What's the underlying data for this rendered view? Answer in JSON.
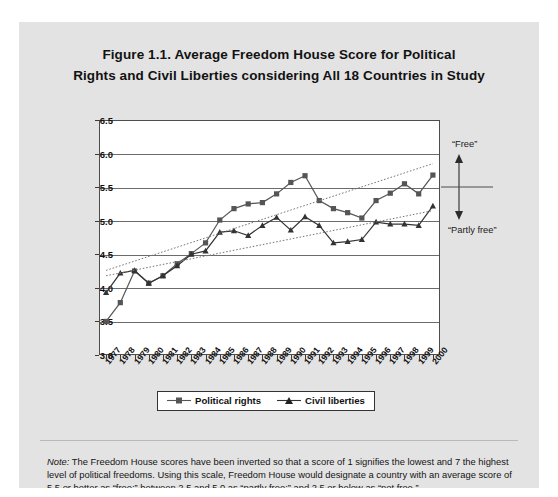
{
  "figure": {
    "title_line1": "Figure 1.1.  Average Freedom House Score for Political",
    "title_line2": "Rights and Civil Liberties considering All 18 Countries in Study",
    "note_prefix": "Note:",
    "note_text": " The Freedom House scores have been inverted so that a score of 1 signifies the lowest and 7 the highest level of political freedoms. Using this scale, Freedom House would designate a country with an average score of 5.5 or better as “free;” between 2.5 and 5.0 as “partly free;” and 2.5 or below as “not free.”"
  },
  "annotations": {
    "free": "“Free”",
    "partly_free": "“Partly free”",
    "threshold_value": 5.5
  },
  "legend": {
    "position": "bottom",
    "items": [
      {
        "label": "Political rights",
        "marker": "square",
        "color": "#555555"
      },
      {
        "label": "Civil liberties",
        "marker": "triangle",
        "color": "#333333"
      }
    ]
  },
  "chart_data": {
    "type": "line",
    "title": "Figure 1.1. Average Freedom House Score for Political Rights and Civil Liberties considering All 18 Countries in Study",
    "xlabel": "",
    "ylabel": "",
    "grid": true,
    "ylim": [
      3.0,
      6.5
    ],
    "yticks": [
      "3.0",
      "3.5",
      "4.0",
      "4.5",
      "5.0",
      "5.5",
      "6.0",
      "6.5"
    ],
    "categories": [
      "1977",
      "1978",
      "1979",
      "1980",
      "1981",
      "1982",
      "1983",
      "1984",
      "1985",
      "1986",
      "1987",
      "1988",
      "1989",
      "1990",
      "1991",
      "1992",
      "1993",
      "1994",
      "1995",
      "1996",
      "1997",
      "1998",
      "1999",
      "2000"
    ],
    "series": [
      {
        "name": "Political rights",
        "marker": "square",
        "color": "#555555",
        "values": [
          3.5,
          3.78,
          4.25,
          4.07,
          4.18,
          4.36,
          4.51,
          4.67,
          5.01,
          5.18,
          5.25,
          5.27,
          5.4,
          5.57,
          5.67,
          5.3,
          5.18,
          5.12,
          5.04,
          5.3,
          5.41,
          5.55,
          5.4,
          5.68
        ]
      },
      {
        "name": "Civil liberties",
        "marker": "triangle",
        "color": "#333333",
        "values": [
          3.93,
          4.22,
          4.26,
          4.07,
          4.18,
          4.33,
          4.5,
          4.55,
          4.83,
          4.85,
          4.78,
          4.93,
          5.05,
          4.86,
          5.06,
          4.93,
          4.67,
          4.69,
          4.72,
          4.98,
          4.95,
          4.95,
          4.93,
          5.22
        ]
      }
    ],
    "trendlines": [
      {
        "for": "Political rights",
        "style": "dotted",
        "start": [
          1977,
          4.26
        ],
        "end": [
          2000,
          5.85
        ]
      },
      {
        "for": "Civil liberties",
        "style": "dotted",
        "start": [
          1977,
          4.18
        ],
        "end": [
          2000,
          5.15
        ]
      }
    ]
  }
}
